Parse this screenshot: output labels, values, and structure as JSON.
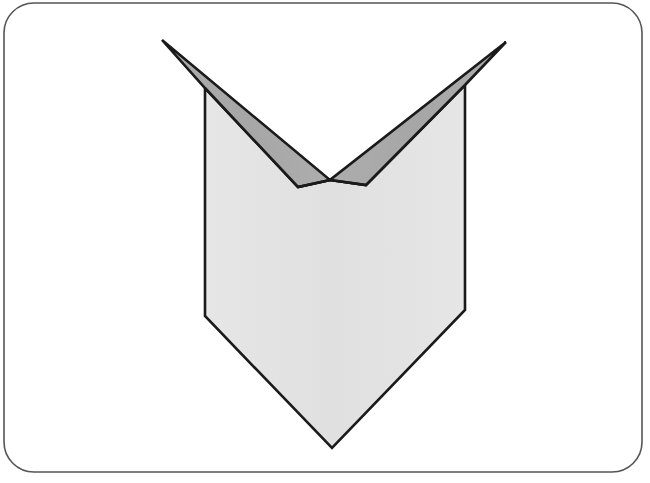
{
  "canvas": {
    "width": 650,
    "height": 483,
    "background_color": "#ffffff"
  },
  "frame": {
    "name": "card-frame",
    "shape": "rounded-rectangle",
    "x": 4,
    "y": 3,
    "width": 638,
    "height": 469,
    "corner_radius": 30,
    "stroke_color": "#555555",
    "stroke_width": 1.6,
    "fill_color": "#ffffff"
  },
  "figure": {
    "name": "chevron-banner-shape",
    "outline_color": "#1a1a1a",
    "outline_width": 2.6,
    "body": {
      "name": "banner-body",
      "fill_color": "#e3e3e3",
      "points": "205,88 298,187 330,180 366,185 465,85 465,310 332,448 205,316"
    },
    "left_arm": {
      "name": "left-arm-band",
      "fill_color": "#a9a9a9",
      "points": "162,40 205,88 298,187 330,180"
    },
    "right_arm": {
      "name": "right-arm-band",
      "fill_color": "#a9a9a9",
      "points": "506,42 465,85 366,185 330,180"
    },
    "vertices": {
      "left_arm_tip": [
        162,
        40
      ],
      "right_arm_tip": [
        506,
        42
      ],
      "left_body_top": [
        205,
        88
      ],
      "right_body_top": [
        465,
        85
      ],
      "notch_left_shoulder": [
        298,
        187
      ],
      "notch_point": [
        330,
        180
      ],
      "notch_right_shoulder": [
        366,
        185
      ],
      "left_body_corner": [
        205,
        316
      ],
      "right_body_corner": [
        465,
        310
      ],
      "bottom_point": [
        332,
        448
      ]
    }
  }
}
